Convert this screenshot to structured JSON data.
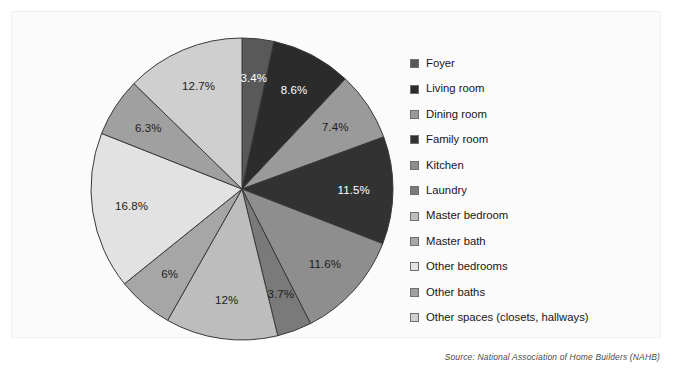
{
  "chart_data": {
    "type": "pie",
    "title": "",
    "subtitle": "",
    "xlabel": "",
    "ylabel": "",
    "legend_position": "right",
    "grid": false,
    "units": "percent",
    "start_angle_deg": 0,
    "direction": "clockwise",
    "categories": [
      "Foyer",
      "Living room",
      "Dining room",
      "Family room",
      "Kitchen",
      "Laundry",
      "Master bedroom",
      "Master bath",
      "Other bedrooms",
      "Other baths",
      "Other spaces (closets, hallways)"
    ],
    "values": [
      3.4,
      8.6,
      7.4,
      11.5,
      11.6,
      3.7,
      12,
      6,
      16.8,
      6.3,
      12.7
    ],
    "value_labels": [
      "3.4%",
      "8.6%",
      "7.4%",
      "11.5%",
      "11.6%",
      "3.7%",
      "12%",
      "6%",
      "16.8%",
      "6.3%",
      "12.7%"
    ],
    "colors": [
      "#595959",
      "#2b2b2b",
      "#9a9a9a",
      "#323232",
      "#8e8e8e",
      "#7a7a7a",
      "#bdbdbd",
      "#a6a6a6",
      "#e2e2e2",
      "#a0a0a0",
      "#cfcfcf"
    ],
    "label_text_colors": [
      "light",
      "light",
      "dark",
      "light",
      "dark",
      "dark",
      "dark",
      "dark",
      "dark",
      "dark",
      "dark"
    ],
    "slice_separator_color": "#3a3a3a"
  },
  "legend": {
    "items": [
      {
        "label": "Foyer",
        "color": "#595959"
      },
      {
        "label": "Living room",
        "color": "#2b2b2b"
      },
      {
        "label": "Dining room",
        "color": "#9a9a9a"
      },
      {
        "label": "Family room",
        "color": "#323232"
      },
      {
        "label": "Kitchen",
        "color": "#8e8e8e"
      },
      {
        "label": "Laundry",
        "color": "#7a7a7a"
      },
      {
        "label": "Master bedroom",
        "color": "#bdbdbd"
      },
      {
        "label": "Master bath",
        "color": "#a6a6a6"
      },
      {
        "label": "Other bedrooms",
        "color": "#e2e2e2"
      },
      {
        "label": "Other baths",
        "color": "#a0a0a0"
      },
      {
        "label": "Other spaces (closets, hallways)",
        "color": "#cfcfcf"
      }
    ]
  },
  "footer": {
    "source": "Source: National Association of Home Builders (NAHB)"
  }
}
